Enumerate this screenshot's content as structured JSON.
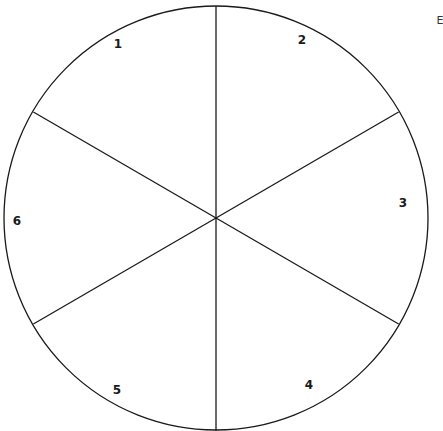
{
  "diagram": {
    "type": "circle-divided-into-six-sectors",
    "stroke_color": "#1a1a1a",
    "background": "#ffffff",
    "sectors": [
      {
        "label": "1",
        "x": 118,
        "y": 48
      },
      {
        "label": "2",
        "x": 302,
        "y": 44
      },
      {
        "label": "3",
        "x": 403,
        "y": 207
      },
      {
        "label": "4",
        "x": 309,
        "y": 389
      },
      {
        "label": "5",
        "x": 117,
        "y": 394
      },
      {
        "label": "6",
        "x": 17,
        "y": 225
      }
    ],
    "edge_label": "E"
  }
}
